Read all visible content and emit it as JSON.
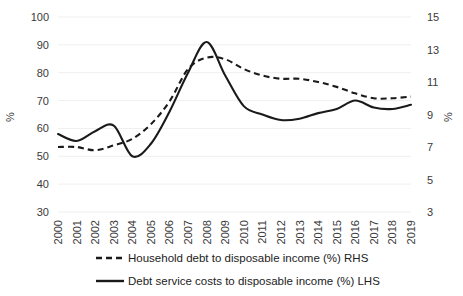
{
  "chart_data": {
    "type": "line",
    "title": "",
    "xlabel": "",
    "ylabel": "%",
    "ylabel_right": "%",
    "grid": true,
    "legend_position": "bottom",
    "categories": [
      "2000",
      "2001",
      "2002",
      "2003",
      "2004",
      "2005",
      "2006",
      "2007",
      "2008",
      "2009",
      "2010",
      "2011",
      "2012",
      "2013",
      "2014",
      "2015",
      "2016",
      "2017",
      "2018",
      "2019"
    ],
    "y_ticks_left": [
      30,
      40,
      50,
      60,
      70,
      80,
      90,
      100
    ],
    "y_ticks_right": [
      3,
      5,
      7,
      9,
      11,
      13,
      15
    ],
    "ylim": [
      30,
      100
    ],
    "ylim_right": [
      3,
      15
    ],
    "series": [
      {
        "name": "Household debt to disposable income (%) RHS",
        "axis": "right",
        "style": "dashed",
        "color": "#1a1a1a",
        "values": [
          7.0,
          7.0,
          6.8,
          7.1,
          7.5,
          8.4,
          9.8,
          11.8,
          12.5,
          12.4,
          11.8,
          11.4,
          11.2,
          11.2,
          11.0,
          10.7,
          10.3,
          10.0,
          10.0,
          10.1
        ]
      },
      {
        "name": "Debt service costs to disposable income  (%) LHS",
        "axis": "left",
        "style": "solid",
        "color": "#1a1a1a",
        "values": [
          58.0,
          55.5,
          59.0,
          61.0,
          50.0,
          54.5,
          66.0,
          80.0,
          91.0,
          79.0,
          68.0,
          65.0,
          63.0,
          63.5,
          65.5,
          67.0,
          70.0,
          67.5,
          67.0,
          68.5
        ]
      }
    ]
  },
  "axes": {
    "left_title": "%",
    "right_title": "%"
  },
  "legend": {
    "items": [
      {
        "label": "Household debt to disposable income (%) RHS",
        "style": "dashed"
      },
      {
        "label": "Debt service costs to disposable income  (%) LHS",
        "style": "solid"
      }
    ]
  }
}
